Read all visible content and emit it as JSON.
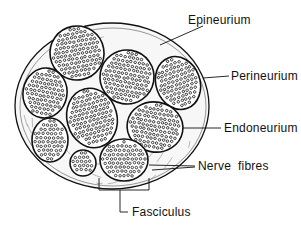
{
  "diagram": {
    "colors": {
      "ink": "#111111",
      "background": "#ffffff",
      "tissue": "#f7f7f7"
    },
    "outer_nerve": {
      "cx": 112,
      "cy": 106,
      "rx": 97,
      "ry": 83
    },
    "fascicles": [
      {
        "id": "f1",
        "cx": 77,
        "cy": 53,
        "rx": 27,
        "ry": 27,
        "rot": -10
      },
      {
        "id": "f2",
        "cx": 127,
        "cy": 77,
        "rx": 27,
        "ry": 27,
        "rot": 10
      },
      {
        "id": "f3",
        "cx": 178,
        "cy": 83,
        "rx": 22,
        "ry": 27,
        "rot": -20
      },
      {
        "id": "f4",
        "cx": 45,
        "cy": 93,
        "rx": 22,
        "ry": 25,
        "rot": 10
      },
      {
        "id": "f5",
        "cx": 92,
        "cy": 118,
        "rx": 25,
        "ry": 30,
        "rot": -15
      },
      {
        "id": "f6",
        "cx": 155,
        "cy": 127,
        "rx": 28,
        "ry": 25,
        "rot": 10
      },
      {
        "id": "f7",
        "cx": 50,
        "cy": 140,
        "rx": 18,
        "ry": 22,
        "rot": 0
      },
      {
        "id": "f8",
        "cx": 83,
        "cy": 163,
        "rx": 13,
        "ry": 13,
        "rot": 0
      },
      {
        "id": "f9",
        "cx": 124,
        "cy": 160,
        "rx": 24,
        "ry": 21,
        "rot": 0
      }
    ],
    "labels": [
      {
        "key": "epineurium",
        "text": "Epineurium",
        "x": 188,
        "y": 14,
        "line": [
          [
            160,
            45
          ],
          [
            203,
            26
          ]
        ]
      },
      {
        "key": "perineurium",
        "text": "Perineurium",
        "x": 231,
        "y": 70,
        "line": [
          [
            203,
            78
          ],
          [
            229,
            76
          ]
        ]
      },
      {
        "key": "endoneurium",
        "text": "Endoneurium",
        "x": 224,
        "y": 122,
        "line": [
          [
            183,
            128
          ],
          [
            221,
            128
          ]
        ]
      },
      {
        "key": "nerve_fibres",
        "text": "Nerve  fibres",
        "x": 198,
        "y": 160,
        "line": [
          [
            149,
            165
          ],
          [
            195,
            166
          ]
        ],
        "line2": [
          [
            152,
            170
          ],
          [
            195,
            167
          ]
        ]
      },
      {
        "key": "fasciculus",
        "text": "Fasciculus",
        "x": 132,
        "y": 207,
        "line": [
          [
            120,
            190
          ],
          [
            120,
            212
          ],
          [
            128,
            212
          ]
        ]
      }
    ],
    "fasciculus_bracket": {
      "x1": 99,
      "x2": 149,
      "ytop": 178,
      "ybottom": 190
    }
  }
}
